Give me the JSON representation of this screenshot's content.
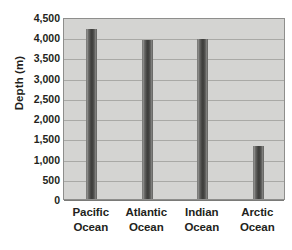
{
  "chart_data": {
    "type": "bar",
    "title": "",
    "xlabel": "",
    "ylabel": "Depth (m)",
    "categories": [
      "Pacific Ocean",
      "Atlantic Ocean",
      "Indian Ocean",
      "Arctic Ocean"
    ],
    "category_lines": [
      [
        "Pacific",
        "Ocean"
      ],
      [
        "Atlantic",
        "Ocean"
      ],
      [
        "Indian",
        "Ocean"
      ],
      [
        "Arctic",
        "Ocean"
      ]
    ],
    "values": [
      4200,
      3930,
      3960,
      1300
    ],
    "ylim": [
      0,
      4500
    ],
    "ytick_step": 500,
    "ytick_labels": [
      "4,500",
      "4,000",
      "3,500",
      "3,000",
      "2,500",
      "2,000",
      "1,500",
      "1,000",
      "500",
      "0"
    ],
    "ytick_values": [
      4500,
      4000,
      3500,
      3000,
      2500,
      2000,
      1500,
      1000,
      500,
      0
    ],
    "grid": true,
    "legend": false,
    "colors": {
      "plot_background": "#d4d4d2",
      "plot_border": "#8e8e8c",
      "gridline": "#a9a9a6",
      "bar_dark": "#3b3b39",
      "bar_light": "#9b9b99",
      "text": "#231f20",
      "page_background": "#ffffff"
    }
  }
}
